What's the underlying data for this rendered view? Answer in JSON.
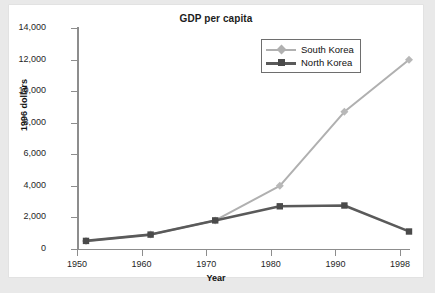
{
  "chart_data": {
    "type": "line",
    "title": "GDP per capita",
    "xlabel": "Year",
    "ylabel": "1996 dollars",
    "categories": [
      "1950",
      "1960",
      "1970",
      "1980",
      "1990",
      "1998"
    ],
    "x": [
      1950,
      1960,
      1970,
      1980,
      1990,
      1998
    ],
    "series": [
      {
        "name": "South Korea",
        "color": "#b0b0b0",
        "marker": "diamond",
        "values": [
          800,
          1200,
          2100,
          4300,
          9000,
          12300
        ]
      },
      {
        "name": "North Korea",
        "color": "#5a5a5a",
        "marker": "square",
        "values": [
          800,
          1200,
          2100,
          3000,
          3050,
          1400
        ]
      }
    ],
    "ylim": [
      0,
      14000
    ],
    "ytick_values": [
      0,
      2000,
      4000,
      6000,
      8000,
      10000,
      12000,
      14000
    ],
    "ytick_labels": [
      "0",
      "2,000",
      "4,000",
      "6,000",
      "8,000",
      "10,000",
      "12,000",
      "14,000"
    ],
    "grid": false,
    "legend_position": "top-right",
    "axis_color": "#8d8d8d",
    "panel_background": "#ffffff",
    "figure_background": "#e9e9e9"
  },
  "legend": {
    "entries": [
      {
        "label": "South Korea"
      },
      {
        "label": "North Korea"
      }
    ]
  }
}
